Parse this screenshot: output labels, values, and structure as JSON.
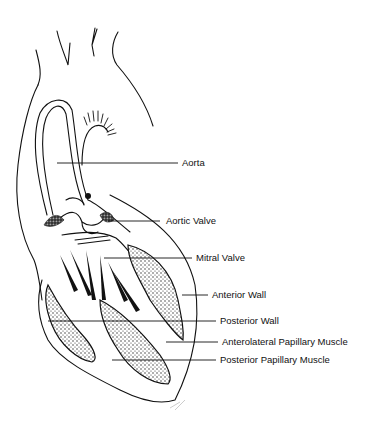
{
  "diagram": {
    "labels": [
      {
        "id": "aorta",
        "text": "Aorta",
        "x": 182,
        "y": 159
      },
      {
        "id": "aortic-valve",
        "text": "Aortic Valve",
        "x": 166,
        "y": 216
      },
      {
        "id": "mitral-valve",
        "text": "Mitral Valve",
        "x": 196,
        "y": 254
      },
      {
        "id": "anterior-wall",
        "text": "Anterior Wall",
        "x": 212,
        "y": 292
      },
      {
        "id": "posterior-wall",
        "text": "Posterior Wall",
        "x": 220,
        "y": 319
      },
      {
        "id": "anterolateral-papillary-muscle",
        "text": "Anterolateral Papillary Muscle",
        "x": 222,
        "y": 338
      },
      {
        "id": "posterior-papillary-muscle",
        "text": "Posterior Papillary Muscle",
        "x": 220,
        "y": 356
      }
    ],
    "colors": {
      "ink": "#111111",
      "background": "#ffffff"
    }
  }
}
